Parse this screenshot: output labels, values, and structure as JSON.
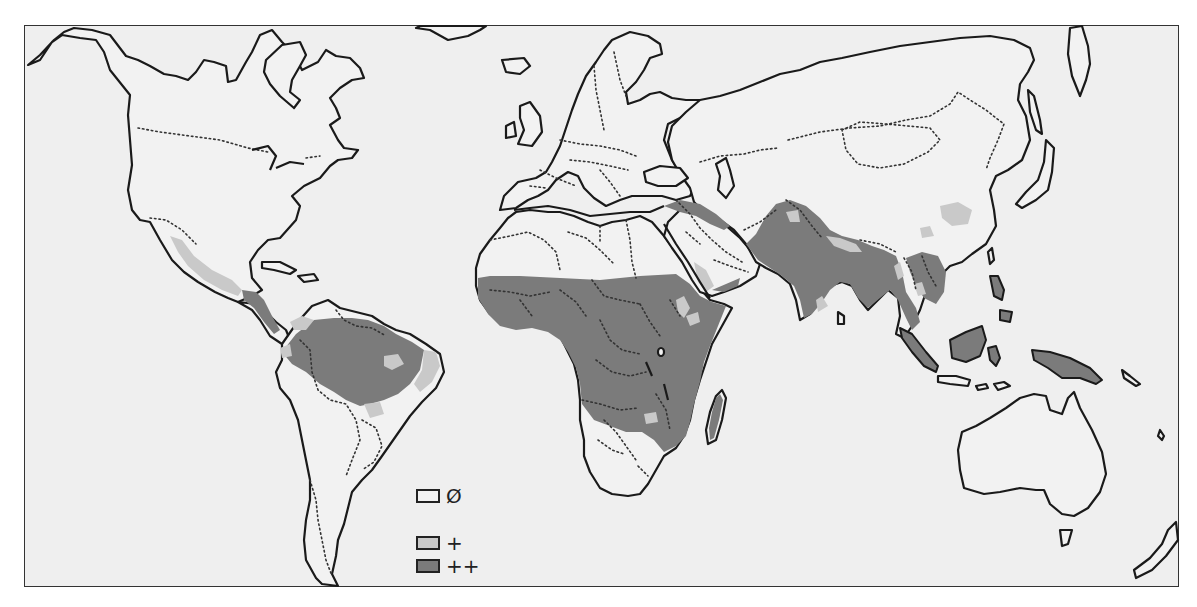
{
  "map": {
    "type": "world-choropleth",
    "projection": "world map, Pacific-cut, frame border",
    "colors": {
      "background": "#efefef",
      "land_none": "#f2f2f2",
      "plus": "#c9c9c9",
      "plus_plus": "#7b7b7b",
      "outline": "#1a1a1a"
    },
    "legend": {
      "items": [
        {
          "key": "none",
          "symbol": "Ø",
          "fill": "#f2f2f2"
        },
        {
          "key": "plus",
          "symbol": "+",
          "fill": "#c9c9c9"
        },
        {
          "key": "plus_plus",
          "symbol": "++",
          "fill": "#7b7b7b"
        }
      ]
    },
    "regions": {
      "plus_plus": [
        "Sub-Saharan Africa (West, Central, East)",
        "Madagascar",
        "Amazon basin / northern South America",
        "Central America",
        "India",
        "Pakistan/Afghanistan region",
        "Southeast Asia (Myanmar, Thailand, Indochina)",
        "Sumatra",
        "Borneo",
        "Sulawesi",
        "New Guinea",
        "Philippines",
        "Southern Arabian Peninsula / Yemen coast"
      ],
      "plus": [
        "Western Mexico",
        "Northeast Brazil",
        "Central Brazil patch",
        "Northern Venezuela",
        "Southern China patches",
        "Northern India fringe",
        "Southern India tip",
        "Zimbabwe patch",
        "Arabian Peninsula southwest",
        "Ethiopian highlands (inner)"
      ],
      "none": [
        "North America",
        "Europe",
        "Northern Africa",
        "Southern Africa",
        "Southern South America",
        "Russia / Northern Asia",
        "Australia",
        "Japan"
      ]
    }
  }
}
